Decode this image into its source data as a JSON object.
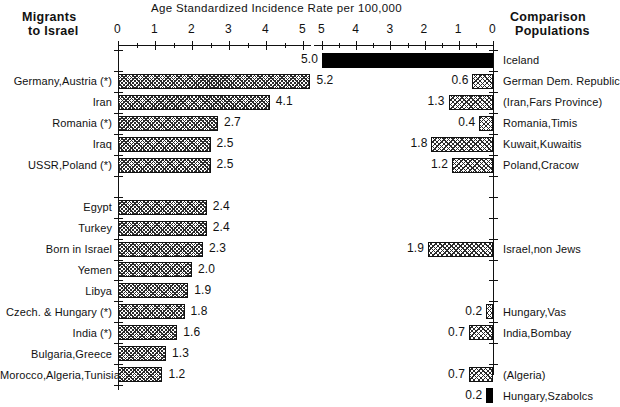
{
  "chart_data": {
    "type": "bar",
    "title": "Age Standardized Incidence Rate per 100,000",
    "xlabel": "Age Standardized Incidence Rate per 100,000",
    "ylabel": "",
    "orientation": "horizontal",
    "grid": false,
    "legend": "none",
    "panels": [
      {
        "name": "left",
        "header": "Migrants\nto Israel",
        "header_line1": "Migrants",
        "header_line2": "to Israel",
        "axis_direction": "left-to-right",
        "xlim": [
          0,
          5
        ],
        "ticks": [
          0,
          1,
          2,
          3,
          4,
          5
        ],
        "tick_labels": [
          "0",
          "1",
          "2",
          "3",
          "4",
          "5"
        ],
        "minor_ticks": [
          0.5,
          1.5,
          2.5,
          3.5,
          4.5
        ],
        "categories": [
          "Germany,Austria (*)",
          "Iran",
          "Romania (*)",
          "Iraq",
          "USSR,Poland (*)",
          "",
          "Egypt",
          "Turkey",
          "Born in Israel",
          "Yemen",
          "Libya",
          "Czech. & Hungary (*)",
          "India (*)",
          "Bulgaria,Greece",
          "Morocco,Algeria,Tunisia"
        ],
        "values": [
          5.2,
          4.1,
          2.7,
          2.5,
          2.5,
          null,
          2.4,
          2.4,
          2.3,
          2.0,
          1.9,
          1.8,
          1.6,
          1.3,
          1.2
        ],
        "value_labels": [
          "5.2",
          "4.1",
          "2.7",
          "2.5",
          "2.5",
          "",
          "2.4",
          "2.4",
          "2.3",
          "2.0",
          "1.9",
          "1.8",
          "1.6",
          "1.3",
          "1.2"
        ]
      },
      {
        "name": "right",
        "header": "Comparison\nPopulations",
        "header_line1": "Comparison",
        "header_line2": "Populations",
        "axis_direction": "right-to-left",
        "xlim": [
          0,
          5
        ],
        "ticks": [
          0,
          1,
          2,
          3,
          4,
          5
        ],
        "tick_labels": [
          "5",
          "4",
          "3",
          "2",
          "1",
          "0"
        ],
        "minor_ticks": [
          0.5,
          1.5,
          2.5,
          3.5,
          4.5
        ],
        "categories": [
          "Iceland",
          "German Dem. Republic",
          "(Iran,Fars Province)",
          "Romania,Timis",
          "Kuwait,Kuwaitis",
          "Poland,Cracow",
          "",
          "",
          "Israel,non Jews",
          "",
          "",
          "Hungary,Vas",
          "India,Bombay",
          "(Algeria)",
          "Hungary,Szabolcs"
        ],
        "values": [
          5.0,
          0.6,
          1.3,
          0.4,
          1.8,
          1.2,
          null,
          null,
          1.9,
          null,
          null,
          0.2,
          0.7,
          0.7,
          0.2
        ],
        "value_labels": [
          "5.0",
          "0.6",
          "1.3",
          "0.4",
          "1.8",
          "1.2",
          "",
          "",
          "1.9",
          "",
          "",
          "0.2",
          "0.7",
          "0.7",
          "0.2"
        ],
        "fills": [
          "solid",
          "hatch",
          "hatch",
          "hatch",
          "hatch",
          "hatch",
          "",
          "",
          "hatch",
          "",
          "",
          "hatch",
          "hatch",
          "hatch",
          "solid"
        ]
      }
    ],
    "rows": [
      {
        "left_label": "",
        "left_value": null,
        "left_value_label": "",
        "right_label": "Iceland",
        "right_value": 5.0,
        "right_value_label": "5.0",
        "right_fill": "solid"
      },
      {
        "left_label": "Germany,Austria (*)",
        "left_value": 5.2,
        "left_value_label": "5.2",
        "right_label": "German Dem. Republic",
        "right_value": 0.6,
        "right_value_label": "0.6",
        "right_fill": "hatch"
      },
      {
        "left_label": "Iran",
        "left_value": 4.1,
        "left_value_label": "4.1",
        "right_label": "(Iran,Fars Province)",
        "right_value": 1.3,
        "right_value_label": "1.3",
        "right_fill": "hatch"
      },
      {
        "left_label": "Romania (*)",
        "left_value": 2.7,
        "left_value_label": "2.7",
        "right_label": "Romania,Timis",
        "right_value": 0.4,
        "right_value_label": "0.4",
        "right_fill": "hatch"
      },
      {
        "left_label": "Iraq",
        "left_value": 2.5,
        "left_value_label": "2.5",
        "right_label": "Kuwait,Kuwaitis",
        "right_value": 1.8,
        "right_value_label": "1.8",
        "right_fill": "hatch"
      },
      {
        "left_label": "USSR,Poland (*)",
        "left_value": 2.5,
        "left_value_label": "2.5",
        "right_label": "Poland,Cracow",
        "right_value": 1.2,
        "right_value_label": "1.2",
        "right_fill": "hatch"
      },
      {
        "left_label": "",
        "left_value": null,
        "left_value_label": "",
        "right_label": "",
        "right_value": null,
        "right_value_label": "",
        "right_fill": ""
      },
      {
        "left_label": "Egypt",
        "left_value": 2.4,
        "left_value_label": "2.4",
        "right_label": "",
        "right_value": null,
        "right_value_label": "",
        "right_fill": ""
      },
      {
        "left_label": "Turkey",
        "left_value": 2.4,
        "left_value_label": "2.4",
        "right_label": "",
        "right_value": null,
        "right_value_label": "",
        "right_fill": ""
      },
      {
        "left_label": "Born in Israel",
        "left_value": 2.3,
        "left_value_label": "2.3",
        "right_label": "Israel,non Jews",
        "right_value": 1.9,
        "right_value_label": "1.9",
        "right_fill": "hatch"
      },
      {
        "left_label": "Yemen",
        "left_value": 2.0,
        "left_value_label": "2.0",
        "right_label": "",
        "right_value": null,
        "right_value_label": "",
        "right_fill": ""
      },
      {
        "left_label": "Libya",
        "left_value": 1.9,
        "left_value_label": "1.9",
        "right_label": "",
        "right_value": null,
        "right_value_label": "",
        "right_fill": ""
      },
      {
        "left_label": "Czech. & Hungary (*)",
        "left_value": 1.8,
        "left_value_label": "1.8",
        "right_label": "Hungary,Vas",
        "right_value": 0.2,
        "right_value_label": "0.2",
        "right_fill": "hatch"
      },
      {
        "left_label": "India (*)",
        "left_value": 1.6,
        "left_value_label": "1.6",
        "right_label": "India,Bombay",
        "right_value": 0.7,
        "right_value_label": "0.7",
        "right_fill": "hatch"
      },
      {
        "left_label": "Bulgaria,Greece",
        "left_value": 1.3,
        "left_value_label": "1.3",
        "right_label": "",
        "right_value": null,
        "right_value_label": "",
        "right_fill": ""
      },
      {
        "left_label": "Morocco,Algeria,Tunisia",
        "left_value": 1.2,
        "left_value_label": "1.2",
        "right_label": "(Algeria)",
        "right_value": 0.7,
        "right_value_label": "0.7",
        "right_fill": "hatch"
      },
      {
        "left_label": "",
        "left_value": null,
        "left_value_label": "",
        "right_label": "Hungary,Szabolcs",
        "right_value": 0.2,
        "right_value_label": "0.2",
        "right_fill": "solid"
      }
    ]
  },
  "colors": {
    "ink": "#111111",
    "bar_fill": "#2b2b2b",
    "solid_bar": "#000000",
    "background": "#ffffff"
  }
}
